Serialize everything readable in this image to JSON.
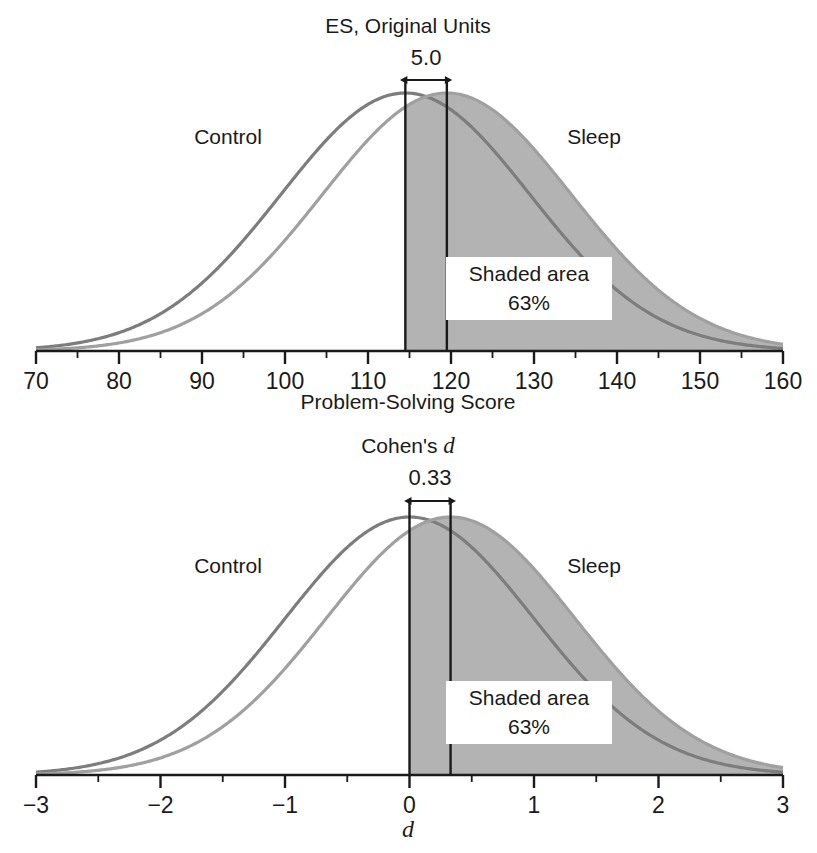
{
  "panels": [
    {
      "id": "original-units",
      "title": "ES, Original Units",
      "effect_label": "5.0",
      "series_labels": {
        "control": "Control",
        "treatment": "Sleep"
      },
      "callout": {
        "line1": "Shaded area",
        "line2": "63%"
      },
      "axis": {
        "label": "Problem-Solving Score",
        "label_italic": "",
        "ticks": [
          "70",
          "80",
          "90",
          "100",
          "110",
          "120",
          "130",
          "140",
          "150",
          "160"
        ]
      }
    },
    {
      "id": "cohens-d",
      "title": "Cohen's ",
      "title_italic": "d",
      "effect_label": "0.33",
      "series_labels": {
        "control": "Control",
        "treatment": "Sleep"
      },
      "callout": {
        "line1": "Shaded area",
        "line2": "63%"
      },
      "axis": {
        "label": "",
        "label_italic": "d",
        "ticks": [
          "−3",
          "−2",
          "−1",
          "0",
          "1",
          "2",
          "3"
        ]
      }
    }
  ],
  "colors": {
    "control_curve": "#7d7d7d",
    "treatment_curve": "#a0a0a0",
    "shaded_area": "#b3b3b3",
    "axis": "#1a1a1a",
    "text": "#1a1a1a",
    "callout_background": "#ffffff"
  },
  "chart_data": [
    {
      "type": "line",
      "id": "original-units",
      "title": "ES, Original Units",
      "xlabel": "Problem-Solving Score",
      "ylabel": "",
      "xlim": [
        70,
        160
      ],
      "xticks": [
        70,
        80,
        90,
        100,
        110,
        120,
        130,
        140,
        150,
        160
      ],
      "minor_tick_step": 5,
      "grid": false,
      "legend": "inline-labels",
      "series": [
        {
          "name": "Control",
          "distribution": "normal",
          "mean": 114.5,
          "sd": 15.0
        },
        {
          "name": "Sleep",
          "distribution": "normal",
          "mean": 119.5,
          "sd": 15.0
        }
      ],
      "annotations": {
        "effect_size": 5.0,
        "effect_size_label": "5.0",
        "marker_lines": [
          114.5,
          119.5
        ],
        "shaded_region": {
          "series": "Sleep",
          "from": 114.5,
          "to": 160,
          "percent": 63,
          "label": "Shaded area 63%"
        }
      }
    },
    {
      "type": "line",
      "id": "cohens-d",
      "title": "Cohen's d",
      "xlabel": "d",
      "ylabel": "",
      "xlim": [
        -3,
        3
      ],
      "xticks": [
        -3,
        -2,
        -1,
        0,
        1,
        2,
        3
      ],
      "minor_tick_step": 0.5,
      "grid": false,
      "legend": "inline-labels",
      "series": [
        {
          "name": "Control",
          "distribution": "normal",
          "mean": 0.0,
          "sd": 1.0
        },
        {
          "name": "Sleep",
          "distribution": "normal",
          "mean": 0.33,
          "sd": 1.0
        }
      ],
      "annotations": {
        "effect_size": 0.33,
        "effect_size_label": "0.33",
        "marker_lines": [
          0.0,
          0.33
        ],
        "shaded_region": {
          "series": "Sleep",
          "from": 0.0,
          "to": 3,
          "percent": 63,
          "label": "Shaded area 63%"
        }
      }
    }
  ]
}
